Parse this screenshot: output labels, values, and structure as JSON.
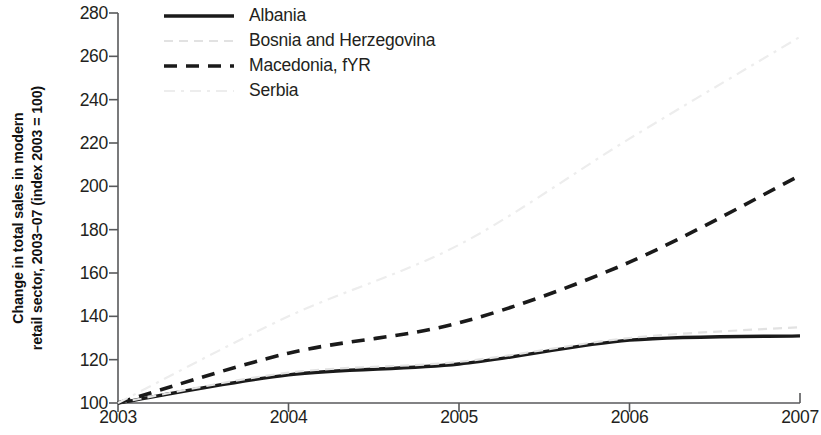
{
  "chart_data": {
    "type": "line",
    "title": "",
    "subtitle": "",
    "xlabel": "",
    "ylabel_lines": [
      "Change in total sales in modern",
      "retail sector, 2003–07 (index 2003 = 100)"
    ],
    "ylabel": "Change in total sales in modern retail sector, 2003–07 (index 2003 = 100)",
    "x": [
      2003,
      2004,
      2005,
      2006,
      2007
    ],
    "xtick_labels": [
      "2003",
      "2004",
      "2005",
      "2006",
      "2007"
    ],
    "ytick_labels": [
      "100",
      "120",
      "140",
      "160",
      "180",
      "200",
      "220",
      "240",
      "260",
      "280"
    ],
    "yticks": [
      100,
      120,
      140,
      160,
      180,
      200,
      220,
      240,
      260,
      280
    ],
    "xlim": [
      2003,
      2007
    ],
    "ylim": [
      100,
      280
    ],
    "grid": false,
    "legend_position": "top-left-inside",
    "series": [
      {
        "name": "Albania",
        "values": [
          100,
          113,
          118,
          129,
          131
        ],
        "style": "solid",
        "color": "#1a1a1a",
        "width": 3.4
      },
      {
        "name": "Bosnia and Herzegovina",
        "values": [
          100,
          114,
          119,
          130,
          135
        ],
        "style": "dotted",
        "color": "#e2e2e2",
        "width": 2.2
      },
      {
        "name": "Macedonia, fYR",
        "values": [
          100,
          123,
          137,
          165,
          205
        ],
        "style": "dashed",
        "color": "#1a1a1a",
        "width": 3.6
      },
      {
        "name": "Serbia",
        "values": [
          100,
          140,
          173,
          222,
          269
        ],
        "style": "dashdot",
        "color": "#ededed",
        "width": 2.2
      }
    ]
  },
  "legend": {
    "items": [
      {
        "label": "Albania"
      },
      {
        "label": "Bosnia and Herzegovina"
      },
      {
        "label": "Macedonia, fYR"
      },
      {
        "label": "Serbia"
      }
    ]
  },
  "axes": {
    "axis_color": "#58595b"
  }
}
